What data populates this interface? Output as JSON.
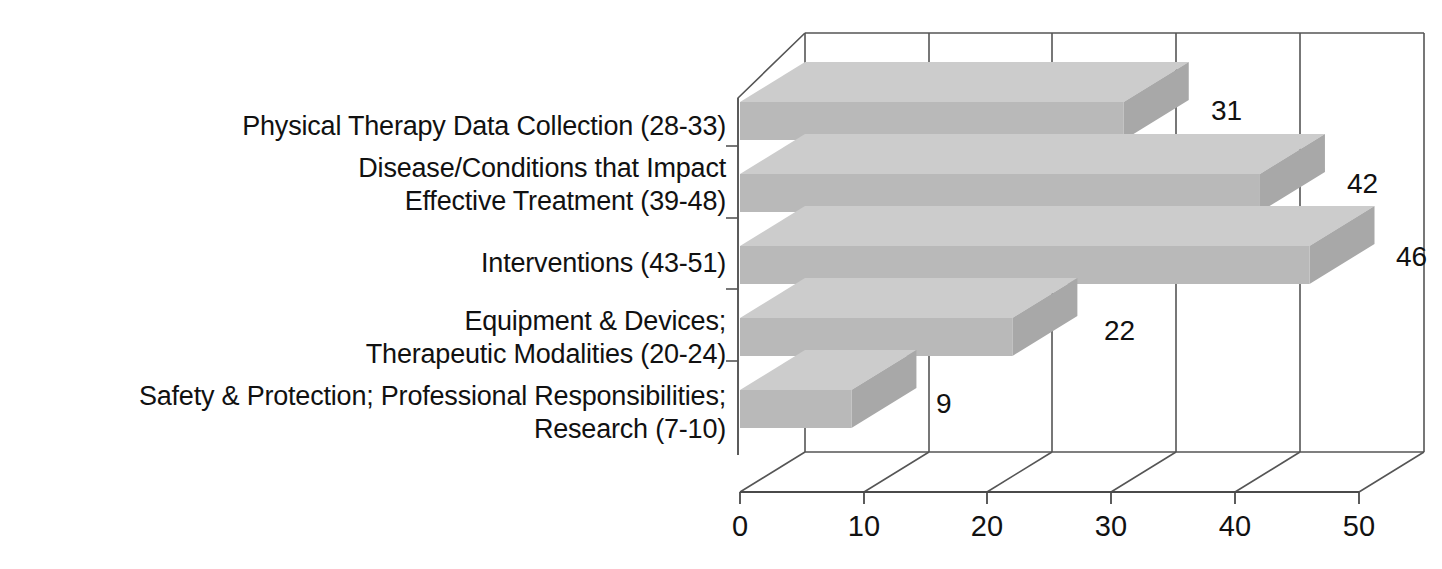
{
  "chart_data": {
    "type": "bar",
    "orientation": "horizontal",
    "style": "3d",
    "title": "",
    "subtitle": "",
    "xlabel": "",
    "ylabel": "",
    "grid": true,
    "legend": false,
    "legend_position": "none",
    "xlim": [
      0,
      50
    ],
    "xticks": [
      0,
      10,
      20,
      30,
      40,
      50
    ],
    "xtick_labels": [
      "0",
      "10",
      "20",
      "30",
      "40",
      "50"
    ],
    "categories": [
      "Physical Therapy Data Collection (28-33)",
      "Disease/Conditions that Impact\nEffective Treatment  (39-48)",
      "Interventions (43-51)",
      "Equipment & Devices;\nTherapeutic Modalities (20-24)",
      "Safety & Protection; Professional Responsibilities;\nResearch (7-10)"
    ],
    "values": [
      31,
      42,
      46,
      22,
      9
    ],
    "value_labels": [
      "31",
      "42",
      "46",
      "22",
      "9"
    ],
    "colors": {
      "bar_top": "#cccccc",
      "bar_front": "#b9b9b9",
      "bar_side": "#a8a8a8",
      "axis_line": "#4a4a4a",
      "grid_line": "#555555",
      "text": "#111111",
      "background": "#ffffff"
    }
  },
  "axis": {
    "ticks": [
      {
        "label": "0",
        "value": 0
      },
      {
        "label": "10",
        "value": 10
      },
      {
        "label": "20",
        "value": 20
      },
      {
        "label": "30",
        "value": 30
      },
      {
        "label": "40",
        "value": 40
      },
      {
        "label": "50",
        "value": 50
      }
    ]
  },
  "bars": [
    {
      "label": "Physical Therapy Data Collection (28-33)",
      "value": 31,
      "value_label": "31"
    },
    {
      "label": "Disease/Conditions that Impact\nEffective Treatment  (39-48)",
      "value": 42,
      "value_label": "42"
    },
    {
      "label": "Interventions (43-51)",
      "value": 46,
      "value_label": "46"
    },
    {
      "label": "Equipment & Devices;\nTherapeutic Modalities (20-24)",
      "value": 22,
      "value_label": "22"
    },
    {
      "label": "Safety & Protection; Professional Responsibilities;\nResearch (7-10)",
      "value": 9,
      "value_label": "9"
    }
  ]
}
